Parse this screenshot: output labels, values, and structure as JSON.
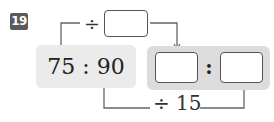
{
  "problem": {
    "number": "19",
    "ratio_text": "75 : 90",
    "left_term": "75",
    "right_term": "90",
    "top_operation": "÷",
    "top_operation_blank": "",
    "bottom_operation": "÷ 15",
    "result_colon": ":",
    "result_left_blank": "",
    "result_right_blank": ""
  },
  "colors": {
    "badge_bg": "#5a5a5a",
    "left_box_bg": "#ebebeb",
    "right_box_bg": "#dcdcdc",
    "line": "#666666"
  }
}
